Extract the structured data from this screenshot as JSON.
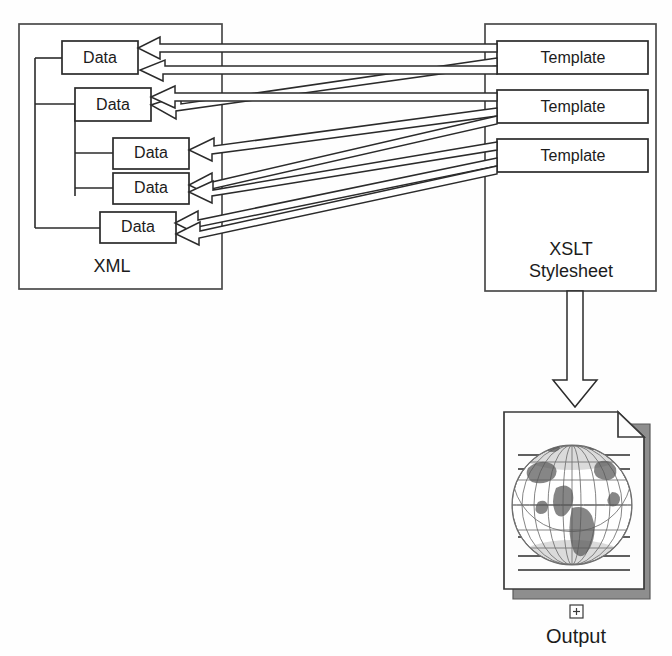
{
  "diagram": {
    "xml_container": {
      "label": "XML",
      "nodes": [
        {
          "label": "Data"
        },
        {
          "label": "Data"
        },
        {
          "label": "Data"
        },
        {
          "label": "Data"
        },
        {
          "label": "Data"
        }
      ]
    },
    "stylesheet_container": {
      "label_line1": "XSLT",
      "label_line2": "Stylesheet",
      "nodes": [
        {
          "label": "Template"
        },
        {
          "label": "Template"
        },
        {
          "label": "Template"
        }
      ]
    },
    "output": {
      "label": "Output",
      "expand_glyph": "+",
      "icon_name": "document-with-globe"
    },
    "colors": {
      "background": "#ffffff",
      "stroke": "#2b2b2b",
      "container_stroke": "#4a4a4a",
      "fill": "#ffffff",
      "document_shadow": "#8e8e8e",
      "globe": "#6f6f6f"
    }
  }
}
